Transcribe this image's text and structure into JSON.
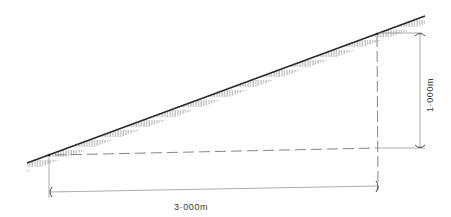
{
  "diagram": {
    "type": "slope-gradient-illustration",
    "horizontal_dimension": {
      "label": "3·000m",
      "value_m": 3.0
    },
    "vertical_dimension": {
      "label": "1·000m",
      "value_m": 1.0
    },
    "colors": {
      "line": "#2a2a2a",
      "hatch": "#555555",
      "dim_line": "#8a8a8a",
      "text": "#3a3a3a"
    }
  }
}
